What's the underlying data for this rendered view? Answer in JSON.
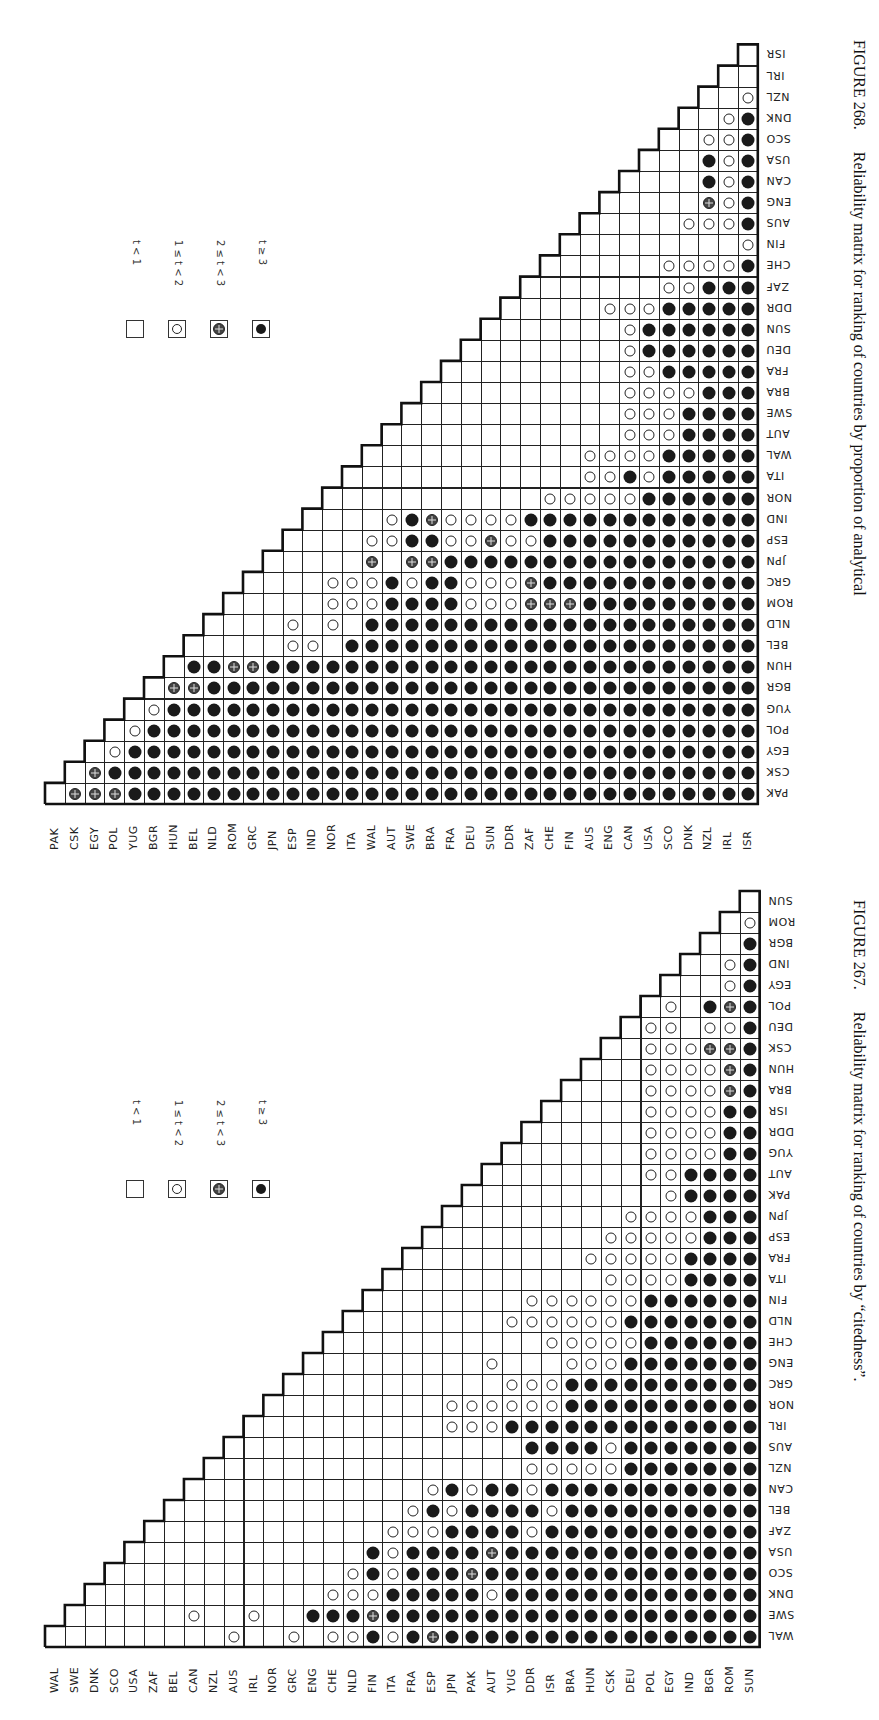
{
  "page": {
    "header_fragment": "… Analytical chemistry …"
  },
  "legend": {
    "items": [
      {
        "code": 0,
        "symbol": "empty-square",
        "label": "t < 1"
      },
      {
        "code": 1,
        "symbol": "open-circle",
        "label": "1 ≤ t < 2"
      },
      {
        "code": 2,
        "symbol": "crossed-circle",
        "label": "2 ≤ t < 3"
      },
      {
        "code": 3,
        "symbol": "filled-circle",
        "label": "t ≥ 3"
      }
    ]
  },
  "chart_data": [
    {
      "type": "heatmap",
      "title": "FIGURE 268. Reliability matrix for ranking of countries by proportion of analytical",
      "figure_number": "FIGURE 268.",
      "caption": "Reliability matrix for ranking of countries by proportion of analytical",
      "encoding": "lower-triangular; rows listed bottom→top, each row string gives codes for columns to the right of the diagonal (0: t<1, 1: 1≤t<2, 2: 2≤t<3, 3: t≥3)",
      "countries": [
        "PAK",
        "CSK",
        "EGY",
        "POL",
        "YUG",
        "BGR",
        "HUN",
        "BEL",
        "NLD",
        "ROM",
        "GRC",
        "JPN",
        "ESP",
        "IND",
        "NOR",
        "ITA",
        "WAL",
        "AUT",
        "SWE",
        "BRA",
        "FRA",
        "DEU",
        "SUN",
        "DDR",
        "ZAF",
        "CHE",
        "FIN",
        "AUS",
        "ENG",
        "CAN",
        "USA",
        "SCO",
        "DNK",
        "NZL",
        "IRL",
        "ISR"
      ],
      "rows": [
        "22233333333333333333333333333333333",
        "2333333333333333333333333333333333",
        "133333333333333333333333333333333",
        "13333333333333333333333333333333",
        "1333333333333333333333333333333",
        "223333333333333333333333333333",
        "33223333333333333333333333333",
        "0000110333333333333333333333",
        "000101033333333333333333333",
        "00001113333111222333333333",
        "0001113133111233333333333",
        "000020223333333333333333",
        "00011331121133333333333",
        "0001321111333333333333",
        "000000000011111333333",
        "00000000000113133333",
        "0000000000111133333",
        "000000000001113333",
        "00000000001113333",
        "0000000001111333",
        "000000001133333",
        "00000001333333",
        "0000001333333",
        "000011133333",
        "00000011333",
        "0000011113",
        "000000001",
        "00001113",
        "0000213",
        "000313",
        "00313",
        "0113",
        "013",
        "01",
        "0",
        ""
      ],
      "legend": [
        "t < 1",
        "1 ≤ t < 2",
        "2 ≤ t < 3",
        "t ≥ 3"
      ]
    },
    {
      "type": "heatmap",
      "title": "FIGURE 267. Reliability matrix for ranking of countries by \"citedness\".",
      "figure_number": "FIGURE 267.",
      "caption": "Reliability matrix for ranking of countries by “citedness”.",
      "encoding": "lower-triangular; rows listed bottom→top, each row string gives codes for columns to the right of the diagonal (0: t<1, 1: 1≤t<2, 2: 2≤t<3, 3: t≥3)",
      "countries": [
        "WAL",
        "SWE",
        "DNK",
        "SCO",
        "USA",
        "ZAF",
        "BEL",
        "CAN",
        "NZL",
        "AUS",
        "IRL",
        "NOR",
        "GRC",
        "ENG",
        "CHE",
        "NLD",
        "FIN",
        "ITA",
        "FRA",
        "ESP",
        "JPN",
        "PAK",
        "AUT",
        "YUG",
        "DDR",
        "ISR",
        "BRA",
        "HUN",
        "CSK",
        "DEU",
        "POL",
        "EGY",
        "IND",
        "BGR",
        "ROM",
        "SUN"
      ],
      "rows": [
        "00000000100101131323333333333333333",
        "0000010010033323333333333333333333",
        "000000000001113333313333333333333",
        "00000000000131333233333333333333",
        "0000000000031333323333333333333",
        "000000000001113333133333333333",
        "00000000000131333313333333333",
        "0000000000013133133333333333",
        "000000000000000111113333333",
        "00000000000000333313333333",
        "0000000001113333333333333",
        "000000001111113333333333",
        "00000000001113333333333",
        "0000000010001113333333",
        "000000000011111333333",
        "00000001111113333333",
        "0000000111111333333",
        "000000000011113333",
        "00000000111113333",
        "0000000011111333",
        "000000001111333",
        "00000000013333",
        "0000000113333",
        "000000111133",
        "00000111133",
        "0000111133",
        "000111123",
        "00111123",
        "0111223",
        "110113",
        "10323",
        "0013",
        "013",
        "03",
        "1",
        ""
      ],
      "legend": [
        "t < 1",
        "1 ≤ t < 2",
        "2 ≤ t < 3",
        "t ≥ 3"
      ]
    }
  ],
  "figures": {
    "f268": {
      "figure_number": "FIGURE 268.",
      "caption": "Reliability matrix for ranking of countries by proportion of analytical"
    },
    "f267": {
      "figure_number": "FIGURE 267.",
      "caption": "Reliability matrix for ranking of countries by “citedness”."
    }
  }
}
